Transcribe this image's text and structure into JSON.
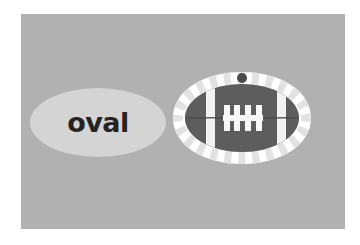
{
  "page": {
    "background_color": "#ffffff",
    "panel": {
      "background_color": "#b1b1b1",
      "x": 21,
      "y": 14,
      "width": 324,
      "height": 215
    }
  },
  "shapes": [
    {
      "name": "oval-word-shape",
      "kind": "ellipse",
      "label": "oval",
      "fill_color": "#d4d4d4",
      "text_color": "#242424",
      "x": 30,
      "y": 88,
      "width": 136,
      "height": 69
    },
    {
      "name": "football-illustration",
      "kind": "football",
      "label": "",
      "ring_color": "#ffffff",
      "ring_gap_color": "#e2e2e2",
      "body_color": "#5d5d5d",
      "stripe_color": "#f2f2f2",
      "lace_color": "#f7f7f7",
      "dot_color": "#4a4a4a",
      "seam_color": "#4a4a4a",
      "x": 170,
      "y": 70,
      "width": 144,
      "height": 96
    }
  ],
  "labels": {
    "oval_word": "oval"
  }
}
